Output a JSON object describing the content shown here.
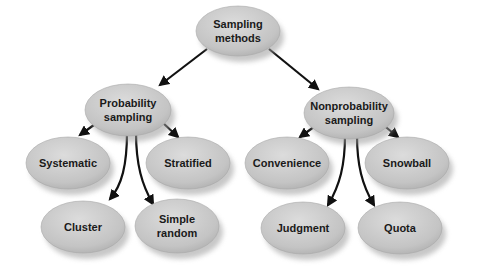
{
  "diagram": {
    "type": "tree",
    "nodes": [
      {
        "id": "root",
        "lines": [
          "Sampling",
          "methods"
        ]
      },
      {
        "id": "prob",
        "lines": [
          "Probability",
          "sampling"
        ]
      },
      {
        "id": "nonprob",
        "lines": [
          "Nonprobability",
          "sampling"
        ]
      },
      {
        "id": "systematic",
        "lines": [
          "Systematic"
        ]
      },
      {
        "id": "stratified",
        "lines": [
          "Stratified"
        ]
      },
      {
        "id": "cluster",
        "lines": [
          "Cluster"
        ]
      },
      {
        "id": "simple",
        "lines": [
          "Simple",
          "random"
        ]
      },
      {
        "id": "convenience",
        "lines": [
          "Convenience"
        ]
      },
      {
        "id": "snowball",
        "lines": [
          "Snowball"
        ]
      },
      {
        "id": "judgment",
        "lines": [
          "Judgment"
        ]
      },
      {
        "id": "quota",
        "lines": [
          "Quota"
        ]
      }
    ],
    "edges": [
      {
        "from": "root",
        "to": "prob"
      },
      {
        "from": "root",
        "to": "nonprob"
      },
      {
        "from": "prob",
        "to": "systematic"
      },
      {
        "from": "prob",
        "to": "stratified"
      },
      {
        "from": "prob",
        "to": "cluster"
      },
      {
        "from": "prob",
        "to": "simple"
      },
      {
        "from": "nonprob",
        "to": "convenience"
      },
      {
        "from": "nonprob",
        "to": "snowball"
      },
      {
        "from": "nonprob",
        "to": "judgment"
      },
      {
        "from": "nonprob",
        "to": "quota"
      }
    ],
    "colors": {
      "node_fill": "#c4c4c4",
      "node_highlight": "#dcdcdc",
      "node_shadow": "#9a9a9a",
      "edge": "#111111",
      "text": "#1a1a1a"
    }
  }
}
